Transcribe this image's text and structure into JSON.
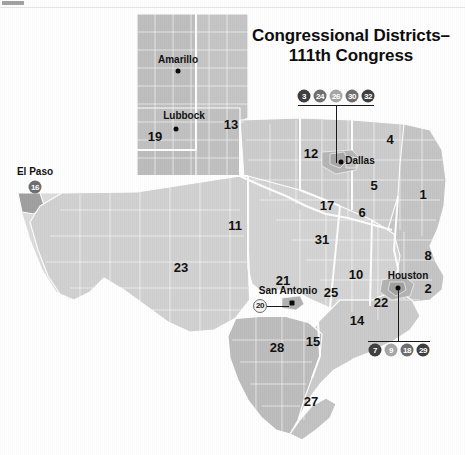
{
  "map": {
    "title_line1": "Congressional Districts–",
    "title_line2": "111th Congress",
    "state": "Texas"
  },
  "cities": [
    {
      "name": "Amarillo",
      "x": 178,
      "y": 60,
      "dot_x": 178,
      "dot_y": 71
    },
    {
      "name": "Lubbock",
      "x": 184,
      "y": 116,
      "dot_x": 176,
      "dot_y": 129
    },
    {
      "name": "Dallas",
      "x": 360,
      "y": 161,
      "dot_x": 341,
      "dot_y": 162
    },
    {
      "name": "Houston",
      "x": 408,
      "y": 276,
      "dot_x": 398,
      "dot_y": 288
    },
    {
      "name": "San Antonio",
      "x": 288,
      "y": 291,
      "dot_x": 292,
      "dot_y": 303
    },
    {
      "name": "El Paso",
      "x": 35,
      "y": 171,
      "dot_x": null,
      "dot_y": null
    }
  ],
  "district_labels": [
    {
      "num": "19",
      "x": 155,
      "y": 136
    },
    {
      "num": "13",
      "x": 231,
      "y": 124
    },
    {
      "num": "12",
      "x": 311,
      "y": 153
    },
    {
      "num": "4",
      "x": 390,
      "y": 139
    },
    {
      "num": "5",
      "x": 374,
      "y": 185
    },
    {
      "num": "1",
      "x": 423,
      "y": 194
    },
    {
      "num": "17",
      "x": 327,
      "y": 205
    },
    {
      "num": "6",
      "x": 362,
      "y": 212
    },
    {
      "num": "11",
      "x": 235,
      "y": 225
    },
    {
      "num": "31",
      "x": 322,
      "y": 239
    },
    {
      "num": "8",
      "x": 428,
      "y": 255
    },
    {
      "num": "23",
      "x": 181,
      "y": 267
    },
    {
      "num": "10",
      "x": 356,
      "y": 274
    },
    {
      "num": "2",
      "x": 428,
      "y": 288
    },
    {
      "num": "21",
      "x": 283,
      "y": 280
    },
    {
      "num": "25",
      "x": 331,
      "y": 292
    },
    {
      "num": "22",
      "x": 381,
      "y": 302
    },
    {
      "num": "14",
      "x": 357,
      "y": 320
    },
    {
      "num": "15",
      "x": 313,
      "y": 341
    },
    {
      "num": "28",
      "x": 277,
      "y": 347
    },
    {
      "num": "27",
      "x": 311,
      "y": 401
    }
  ],
  "callouts": [
    {
      "name": "dallas-callout",
      "badges": [
        {
          "label": "3",
          "x": 304,
          "y": 96,
          "tone": "dark"
        },
        {
          "label": "24",
          "x": 320,
          "y": 96,
          "tone": "mid"
        },
        {
          "label": "26",
          "x": 336,
          "y": 96,
          "tone": "light"
        },
        {
          "label": "30",
          "x": 352,
          "y": 96,
          "tone": "mid"
        },
        {
          "label": "32",
          "x": 368,
          "y": 96,
          "tone": "dark"
        }
      ],
      "rule": {
        "x": 298,
        "y": 105,
        "w": 76
      },
      "stem": {
        "x": 336,
        "y": 105,
        "h": 58
      }
    },
    {
      "name": "houston-callout",
      "badges": [
        {
          "label": "7",
          "x": 375,
          "y": 350,
          "tone": "dark"
        },
        {
          "label": "9",
          "x": 391,
          "y": 350,
          "tone": "light"
        },
        {
          "label": "18",
          "x": 407,
          "y": 350,
          "tone": "mid"
        },
        {
          "label": "29",
          "x": 423,
          "y": 350,
          "tone": "dark"
        }
      ],
      "rule": {
        "x": 368,
        "y": 341,
        "w": 62
      },
      "stem": {
        "x": 398,
        "y": 289,
        "h": 52
      }
    },
    {
      "name": "el-paso-callout",
      "badges": [
        {
          "label": "16",
          "x": 35,
          "y": 187,
          "tone": "mid"
        }
      ]
    },
    {
      "name": "san-antonio-callout",
      "badges": [
        {
          "label": "20",
          "x": 260,
          "y": 306,
          "tone": "white"
        }
      ],
      "rule": {
        "x": 267,
        "y": 306,
        "w": 22
      }
    }
  ]
}
